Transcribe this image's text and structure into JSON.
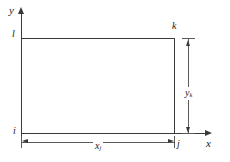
{
  "figure": {
    "type": "engineering-element-diagram",
    "background_color": "#ffffff",
    "line_color": "#3a3a3a",
    "text_color": "#1a1a1a",
    "axes": {
      "x_label": "x",
      "y_label": "y"
    },
    "nodes": {
      "bottom_left": "i",
      "bottom_right": "j",
      "top_right": "k",
      "top_left": "l"
    },
    "dimensions": {
      "horizontal": {
        "symbol": "x",
        "subscript": "j"
      },
      "vertical": {
        "symbol": "y",
        "subscript": "k"
      }
    }
  }
}
